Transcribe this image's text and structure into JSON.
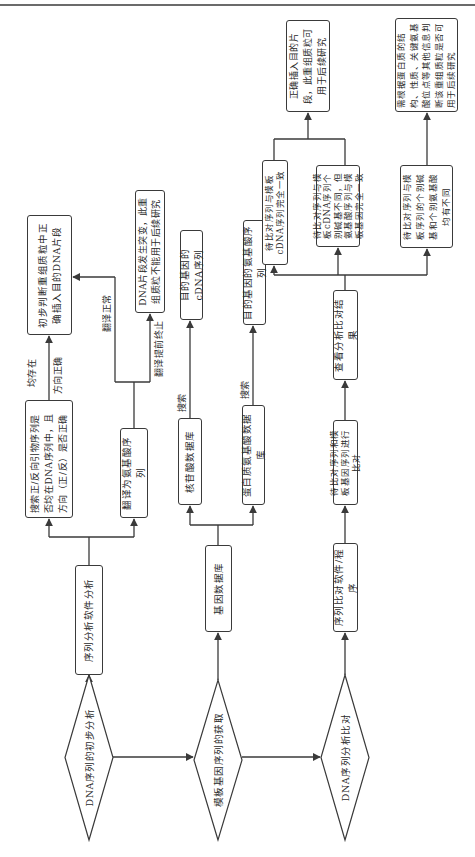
{
  "diagram": {
    "orientation": "rotated-90-ccw",
    "colors": {
      "line": "#3a3a3a",
      "text": "#2a2a2a",
      "background": "#ffffff"
    },
    "root_nodes": [
      {
        "id": "d1",
        "shape": "diamond",
        "label": "DNA序列的初步分析"
      },
      {
        "id": "d2",
        "shape": "diamond",
        "label": "模板基因序列的获取"
      },
      {
        "id": "d3",
        "shape": "diamond",
        "label": "DNA序列分析比对"
      }
    ],
    "nodes": {
      "seq_software": "序列分析软件分析",
      "gene_db": "基因数据库",
      "align_software": "序列比对软件/程序",
      "primer_search": "搜索正/反向引物序列是否均在DNA序列中，且方向（正/反）是否正确",
      "translate_aa": "翻译为氨基酸序列",
      "nucleotide_db": "核苷酸数据库",
      "protein_db": "蛋白质氨基酸数据库",
      "align_step": "待比对序列和模板基因序列进行比对",
      "view_results": "查看分析比对结果",
      "prelim_judge": "初步判断重组质粒中正确插入目的DNA片段",
      "mutation": "DNA片段发生突变，此重组质粒不能用于后续研究",
      "target_cdna": "目的基因的cDNA序列",
      "target_aa": "目的基因的氨基酸序列",
      "fully_match": "待比对序列与模板cDNA序列完全一致",
      "base_diff_aa_same": "待比对序列与模板cDNA序列个别碱基不同，但氨基酸序列与模板基因完全一致",
      "base_and_aa_diff": "待比对序列与模板序列的个别碱基和个别氨基酸均有不同",
      "correct_insert": "正确插入目的片段，此重组质粒可用于后续研究",
      "need_protein_check": "需根据蛋白质的结构、性质、关键氨基酸位点等其他信息判断该重组质粒是否可用于后续研究"
    },
    "edge_labels": {
      "both_exist_line1": "均存在",
      "both_exist_line2": "方向正确",
      "translation_normal": "翻译正常",
      "translation_early_stop": "翻译提前终止",
      "search1": "搜索",
      "search2": "搜索"
    },
    "edges": [
      [
        "d1",
        "d2"
      ],
      [
        "d2",
        "d3"
      ],
      [
        "d1",
        "seq_software"
      ],
      [
        "d2",
        "gene_db"
      ],
      [
        "d3",
        "align_software"
      ],
      [
        "seq_software",
        "primer_search"
      ],
      [
        "seq_software",
        "translate_aa"
      ],
      [
        "primer_search",
        "prelim_judge",
        "均存在 方向正确"
      ],
      [
        "translate_aa",
        "prelim_judge",
        "翻译正常"
      ],
      [
        "translate_aa",
        "mutation",
        "翻译提前终止"
      ],
      [
        "gene_db",
        "nucleotide_db"
      ],
      [
        "gene_db",
        "protein_db"
      ],
      [
        "nucleotide_db",
        "target_cdna",
        "搜索"
      ],
      [
        "protein_db",
        "target_aa",
        "搜索"
      ],
      [
        "align_software",
        "align_step"
      ],
      [
        "align_step",
        "view_results"
      ],
      [
        "view_results",
        "fully_match"
      ],
      [
        "view_results",
        "base_diff_aa_same"
      ],
      [
        "view_results",
        "base_and_aa_diff"
      ],
      [
        "fully_match",
        "correct_insert"
      ],
      [
        "base_diff_aa_same",
        "correct_insert"
      ],
      [
        "base_and_aa_diff",
        "need_protein_check"
      ]
    ]
  }
}
